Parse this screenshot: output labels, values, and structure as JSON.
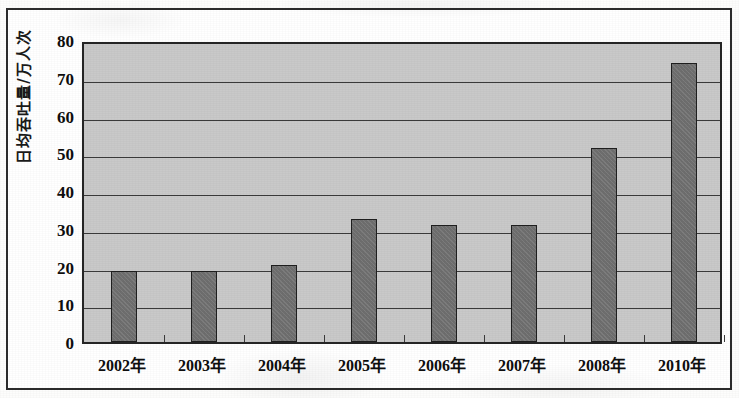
{
  "figure": {
    "frame_border_color": "#2c2c2c",
    "page_background": "#ffffff"
  },
  "chart_data": {
    "type": "bar",
    "title": "",
    "xlabel": "",
    "ylabel": "日均吞吐量/万人次",
    "categories": [
      "2002年",
      "2003年",
      "2004年",
      "2005年",
      "2006年",
      "2007年",
      "2008年",
      "2010年"
    ],
    "values": [
      18.7,
      18.7,
      20.5,
      32.5,
      31.0,
      31.0,
      51.5,
      73.8
    ],
    "ylim": [
      0,
      80
    ],
    "ytick_values": [
      0,
      10,
      20,
      30,
      40,
      50,
      60,
      70,
      80
    ],
    "ytick_labels": [
      "0",
      "10",
      "20",
      "30",
      "40",
      "50",
      "60",
      "70",
      "80"
    ],
    "grid": true,
    "grid_axis": "y",
    "legend": false,
    "legend_position": "none",
    "series": [
      {
        "name": "日均吞吐量",
        "values": [
          18.7,
          18.7,
          20.5,
          32.5,
          31.0,
          31.0,
          51.5,
          73.8
        ]
      }
    ],
    "colors": {
      "bar_fill": "#6e6e6e",
      "bar_border": "#1f1f1f",
      "plot_background": "#c9c9c9",
      "gridline": "#3a3a3a",
      "axis": "#262626",
      "text": "#0e0e0e"
    }
  }
}
